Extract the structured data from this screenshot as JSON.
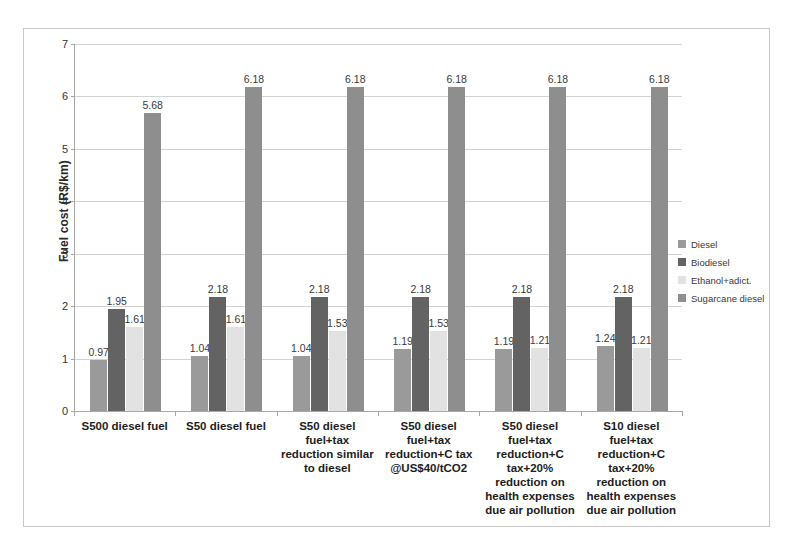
{
  "chart_data": {
    "type": "bar",
    "title": "",
    "subtitle": "",
    "xlabel": "",
    "ylabel": "Fuel cost (R$/km)",
    "ylim": [
      0,
      7
    ],
    "ytick_labels": [
      "0",
      "1",
      "2",
      "3",
      "4",
      "5",
      "6",
      "7"
    ],
    "ytick_values": [
      0,
      1,
      2,
      3,
      4,
      5,
      6,
      7
    ],
    "grid": true,
    "legend_position": "right",
    "categories": [
      "S500 diesel fuel",
      "S50 diesel fuel",
      "S50 diesel fuel+tax reduction similar to diesel",
      "S50 diesel fuel+tax reduction+C tax @US$40/tCO2",
      "S50 diesel fuel+tax reduction+C tax+20% reduction on health expenses due air pollution",
      "S10 diesel fuel+tax reduction+C tax+20% reduction on health expenses due air pollution"
    ],
    "category_lines": [
      [
        "S500 diesel fuel"
      ],
      [
        "S50 diesel fuel"
      ],
      [
        "S50 diesel",
        "fuel+tax",
        "reduction similar",
        "to diesel"
      ],
      [
        "S50 diesel",
        "fuel+tax",
        "reduction+C tax",
        "@US$40/tCO2"
      ],
      [
        "S50 diesel",
        "fuel+tax",
        "reduction+C",
        "tax+20%",
        "reduction on",
        "health expenses",
        "due air pollution"
      ],
      [
        "S10 diesel",
        "fuel+tax",
        "reduction+C",
        "tax+20%",
        "reduction on",
        "health expenses",
        "due air pollution"
      ]
    ],
    "series": [
      {
        "name": "Diesel",
        "color": "#9a9a9a",
        "values": [
          0.97,
          1.04,
          1.04,
          1.19,
          1.19,
          1.24
        ]
      },
      {
        "name": "Biodiesel",
        "color": "#636363",
        "values": [
          1.95,
          2.18,
          2.18,
          2.18,
          2.18,
          2.18
        ]
      },
      {
        "name": "Ethanol+adict.",
        "color": "#e2e2e2",
        "values": [
          1.61,
          1.61,
          1.53,
          1.53,
          1.21,
          1.21
        ]
      },
      {
        "name": "Sugarcane diesel",
        "color": "#8e8e8e",
        "values": [
          5.68,
          6.18,
          6.18,
          6.18,
          6.18,
          6.18
        ]
      }
    ],
    "data_labels": [
      [
        "0.97",
        "1.95",
        "1.61",
        "5.68"
      ],
      [
        "1.04",
        "2.18",
        "1.61",
        "6.18"
      ],
      [
        "1.04",
        "2.18",
        "1.53",
        "6.18"
      ],
      [
        "1.19",
        "2.18",
        "1.53",
        "6.18"
      ],
      [
        "1.19",
        "2.18",
        "1.21",
        "6.18"
      ],
      [
        "1.24",
        "2.18",
        "1.21",
        "6.18"
      ]
    ]
  },
  "legend": {
    "items": [
      {
        "label": "Diesel",
        "color": "#9a9a9a"
      },
      {
        "label": "Biodiesel",
        "color": "#636363"
      },
      {
        "label": "Ethanol+adict.",
        "color": "#e2e2e2"
      },
      {
        "label": "Sugarcane diesel",
        "color": "#8e8e8e"
      }
    ]
  }
}
